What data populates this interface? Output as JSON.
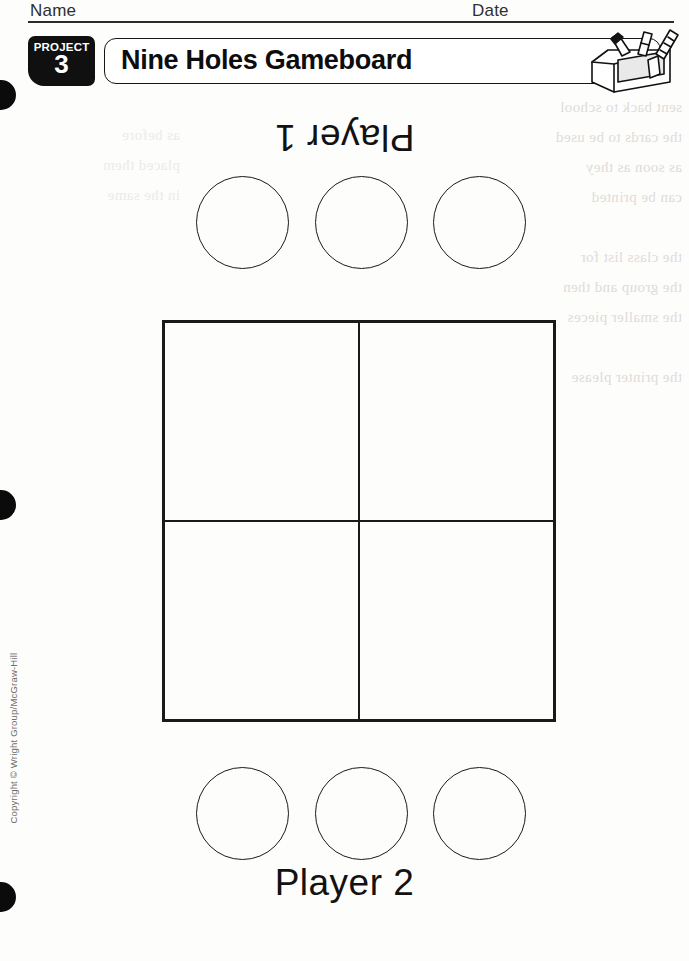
{
  "worksheet": {
    "name_label": "Name",
    "date_label": "Date",
    "project_word": "PROJECT",
    "project_number": "3",
    "title": "Nine Holes Gameboard",
    "copyright": "Copyright © Wright Group/McGraw-Hill",
    "illustration_name": "toolbox-with-craft-tools"
  },
  "players": [
    {
      "label": "Player 1",
      "orientation": "upside-down",
      "piece_count": 3
    },
    {
      "label": "Player 2",
      "orientation": "upright",
      "piece_count": 3
    }
  ],
  "gameboard": {
    "description": "Nine Holes grid: two vertical and two horizontal lines forming nine playable intersection points",
    "columns": 2,
    "rows": 2,
    "line_color": "#1a1a1a",
    "border_width_px": 3
  },
  "binding_dots": [
    {
      "top": 80
    },
    {
      "top": 490
    },
    {
      "top": 882
    }
  ],
  "bleed_through": {
    "right": "sent back to school\nthe cards to be used\nas soon as they\ncan be printed\n\nthe class list for\nthe group and then\nthe smaller pieces\n\nthe printer please",
    "left": "as before\nplaced them\nin the same"
  },
  "colors": {
    "ink": "#1a1a1a",
    "badge_background": "#101010",
    "badge_text": "#ffffff",
    "paper": "#fdfdfc",
    "bleed": "#dedcd8"
  }
}
